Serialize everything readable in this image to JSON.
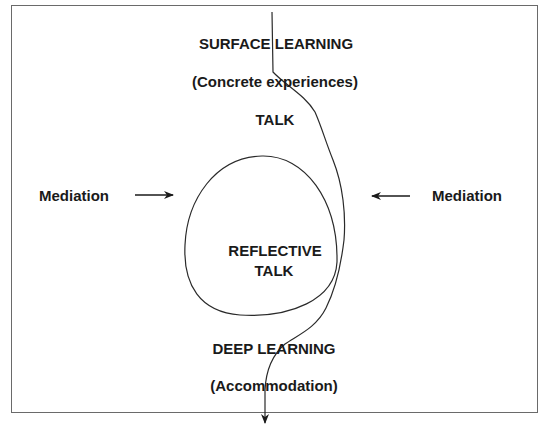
{
  "diagram": {
    "labels": {
      "surface_learning": "SURFACE LEARNING",
      "concrete_experiences": "(Concrete experiences)",
      "talk": "TALK",
      "reflective_talk_line1": "REFLECTIVE",
      "reflective_talk_line2": "TALK",
      "deep_learning": "DEEP LEARNING",
      "accommodation": "(Accommodation)",
      "mediation_left": "Mediation",
      "mediation_right": "Mediation"
    },
    "colors": {
      "stroke": "#2a2a2a",
      "text": "#1a1a1a",
      "frame": "#6a6a6a"
    }
  }
}
